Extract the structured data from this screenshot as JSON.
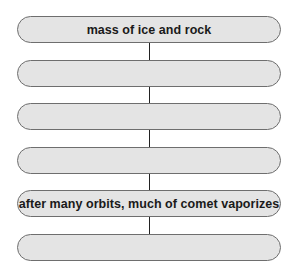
{
  "flowchart": {
    "boxes": [
      {
        "label": "mass of ice and rock"
      },
      {
        "label": ""
      },
      {
        "label": ""
      },
      {
        "label": ""
      },
      {
        "label": "after many orbits, much of comet vaporizes"
      },
      {
        "label": ""
      }
    ],
    "colors": {
      "box_fill": "#e4e4e4",
      "box_border": "#6e6e6e",
      "connector": "#222222",
      "text": "#1a1a1a"
    }
  }
}
